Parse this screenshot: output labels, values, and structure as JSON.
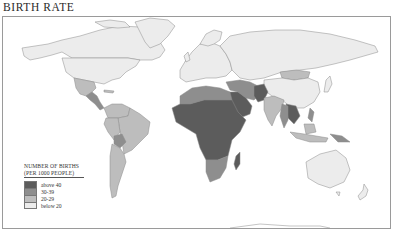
{
  "title": "BIRTH RATE",
  "legend": {
    "heading_line1": "NUMBER OF BIRTHS",
    "heading_line2": "(PER 1000 PEOPLE)",
    "items": [
      {
        "label": "above 40",
        "color": "#5c5c5c"
      },
      {
        "label": "30-39",
        "color": "#8e8e8e"
      },
      {
        "label": "20-29",
        "color": "#bdbdbd"
      },
      {
        "label": "below 20",
        "color": "#ececec"
      }
    ]
  },
  "colors": {
    "above_40": "#5c5c5c",
    "c30_39": "#8e8e8e",
    "c20_29": "#bdbdbd",
    "below_20": "#ececec",
    "border": "#8a8a8a",
    "ocean": "#ffffff"
  },
  "regions": [
    {
      "name": "North America (USA, Canada)",
      "category": "below 20"
    },
    {
      "name": "Greenland",
      "category": "below 20"
    },
    {
      "name": "Mexico",
      "category": "20-29"
    },
    {
      "name": "Central America",
      "category": "30-39"
    },
    {
      "name": "South America (most)",
      "category": "20-29"
    },
    {
      "name": "Bolivia",
      "category": "30-39"
    },
    {
      "name": "Venezuela / Colombia",
      "category": "20-29"
    },
    {
      "name": "Europe",
      "category": "below 20"
    },
    {
      "name": "Russia / USSR",
      "category": "below 20"
    },
    {
      "name": "Mongolia",
      "category": "20-29"
    },
    {
      "name": "China",
      "category": "below 20"
    },
    {
      "name": "North Africa (Algeria, Egypt, Morocco)",
      "category": "30-39"
    },
    {
      "name": "Sub-Saharan Africa",
      "category": "above 40"
    },
    {
      "name": "Southern Africa",
      "category": "30-39"
    },
    {
      "name": "Madagascar",
      "category": "above 40"
    },
    {
      "name": "Middle East (Saudi Arabia, Iraq, Yemen)",
      "category": "above 40"
    },
    {
      "name": "Iran / Turkey",
      "category": "30-39"
    },
    {
      "name": "Afghanistan / Pakistan",
      "category": "above 40"
    },
    {
      "name": "India",
      "category": "20-29"
    },
    {
      "name": "Southeast Asia (Laos, Cambodia)",
      "category": "above 40"
    },
    {
      "name": "Indonesia",
      "category": "20-29"
    },
    {
      "name": "Papua New Guinea",
      "category": "30-39"
    },
    {
      "name": "Australia",
      "category": "below 20"
    },
    {
      "name": "New Zealand",
      "category": "below 20"
    },
    {
      "name": "Antarctica",
      "category": "none"
    }
  ]
}
